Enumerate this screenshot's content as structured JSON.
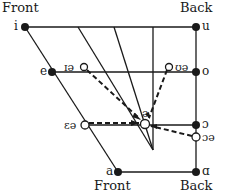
{
  "diagram": {
    "labels": {
      "front_top": "Front",
      "back_top": "Back",
      "front_bottom": "Front",
      "back_bottom": "Back"
    },
    "vowels": [
      {
        "symbol": "i",
        "type": "cardinal",
        "x": 25,
        "y": 27
      },
      {
        "symbol": "u",
        "type": "cardinal",
        "x": 196,
        "y": 27
      },
      {
        "symbol": "e",
        "type": "cardinal",
        "x": 52,
        "y": 72
      },
      {
        "symbol": "o",
        "type": "cardinal",
        "x": 196,
        "y": 72
      },
      {
        "symbol": "ɔ",
        "type": "cardinal",
        "x": 196,
        "y": 125
      },
      {
        "symbol": "a",
        "type": "cardinal",
        "x": 118,
        "y": 172
      },
      {
        "symbol": "ɑ",
        "type": "cardinal",
        "x": 196,
        "y": 172
      }
    ],
    "diphthong_starts": [
      {
        "symbol": "ɪə",
        "x": 84,
        "y": 67
      },
      {
        "symbol": "ʊə",
        "x": 169,
        "y": 67
      },
      {
        "symbol": "ɛə",
        "x": 85,
        "y": 125
      },
      {
        "symbol": "ɔə",
        "x": 196,
        "y": 137
      }
    ],
    "target": {
      "symbol": "ə",
      "x": 145,
      "y": 124
    },
    "colors": {
      "ink": "#1a1a1a",
      "background": "#ffffff"
    }
  }
}
